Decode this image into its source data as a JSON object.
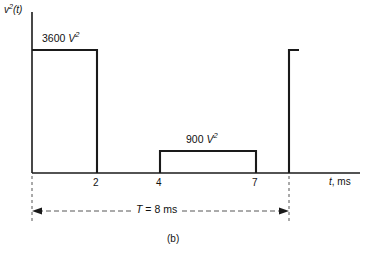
{
  "figure": {
    "caption": "(b)",
    "y_axis_label_base": "v",
    "y_axis_label_exp": "2",
    "y_axis_label_arg": "(t)",
    "x_axis_label_var": "t",
    "x_axis_label_unit": ", ms",
    "period_label_var": "T",
    "period_label_value": "= 8 ms",
    "amplitude_1_value": "3600",
    "amplitude_1_unit": "V",
    "amplitude_1_exp": "2",
    "amplitude_2_value": "900",
    "amplitude_2_unit": "V",
    "amplitude_2_exp": "2",
    "line_color": "#1a1a1a",
    "background_color": "#ffffff"
  },
  "chart_data": {
    "type": "line",
    "title": "",
    "subtitle": "(b)",
    "xlabel": "t, ms",
    "ylabel": "v^2(t)",
    "xlim": [
      0,
      9.6
    ],
    "ylim": [
      0,
      4200
    ],
    "grid": false,
    "legend": null,
    "xticks": [
      2,
      4,
      7
    ],
    "xtick_labels": [
      "2",
      "4",
      "7"
    ],
    "yticks": [],
    "ytick_labels": [],
    "annotations": [
      {
        "text": "3600 V^2",
        "x": 0.6,
        "y": 3600,
        "role": "amplitude-label"
      },
      {
        "text": "900 V^2",
        "x": 5.5,
        "y": 900,
        "role": "amplitude-label"
      },
      {
        "text": "T = 8 ms",
        "x": 4.0,
        "y": -900,
        "role": "period-dimension"
      }
    ],
    "series": [
      {
        "name": "v^2(t)",
        "type": "step",
        "x": [
          0,
          0,
          2,
          2,
          4,
          4,
          7,
          7,
          8,
          8,
          8.3
        ],
        "y": [
          0,
          3600,
          3600,
          0,
          0,
          900,
          900,
          0,
          0,
          3600,
          3600
        ]
      }
    ],
    "pulses": [
      {
        "label": "3600 V^2",
        "start_ms": 0,
        "end_ms": 2,
        "amplitude": 3600
      },
      {
        "label": "900 V^2",
        "start_ms": 4,
        "end_ms": 7,
        "amplitude": 900
      },
      {
        "label": "3600 V^2",
        "start_ms": 8,
        "end_ms": 8.3,
        "amplitude": 3600
      }
    ],
    "period_ms": 8
  }
}
